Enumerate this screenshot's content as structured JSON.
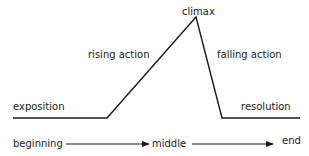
{
  "diagram": {
    "title": "",
    "type": "plot structure (Freytag's pyramid)",
    "line_color": "#1a1a1a",
    "stages": {
      "exposition": "exposition",
      "rising_action": "rising action",
      "climax": "climax",
      "falling_action": "falling action",
      "resolution": "resolution"
    },
    "timeline": {
      "beginning": "beginning",
      "middle": "middle",
      "end": "end"
    }
  }
}
